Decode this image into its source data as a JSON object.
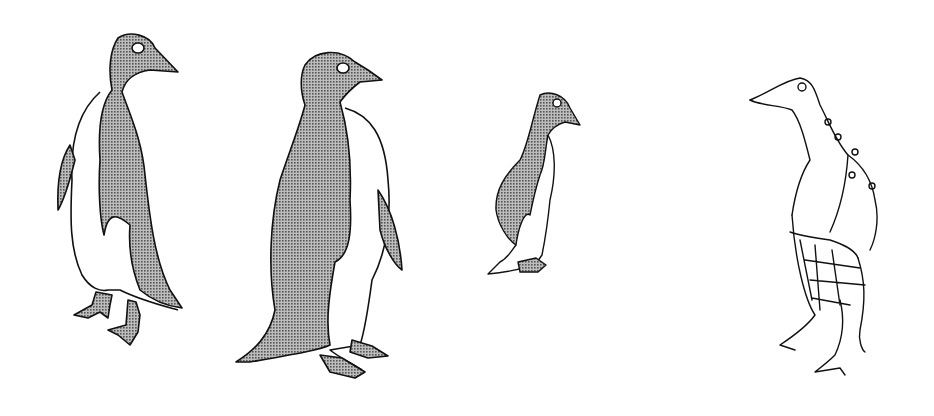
{
  "illustration": {
    "title": "Four penguins",
    "background": "#ffffff",
    "ink": "#111111",
    "fill": "#8a8a8a",
    "penguins": [
      {
        "id": 1,
        "style": "halftone",
        "facing": "right",
        "label": "Penguin with long beak"
      },
      {
        "id": 2,
        "style": "halftone",
        "facing": "right",
        "label": "Large penguin"
      },
      {
        "id": 3,
        "style": "halftone",
        "facing": "right",
        "label": "Small penguin"
      },
      {
        "id": 4,
        "style": "line-sketch",
        "facing": "left",
        "label": "Sketched spotted penguin"
      }
    ]
  }
}
